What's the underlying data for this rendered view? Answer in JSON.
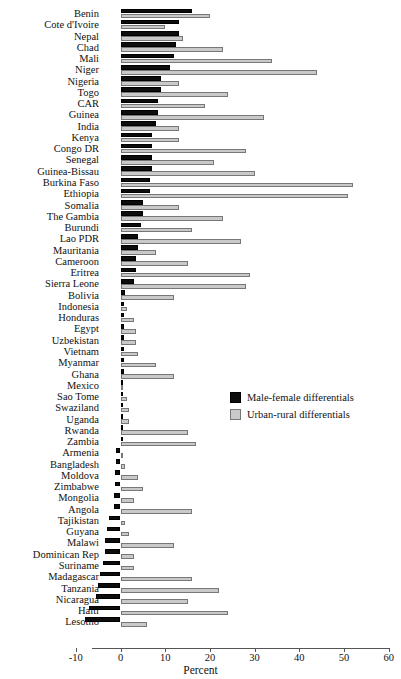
{
  "chart_data": {
    "type": "bar",
    "title": "",
    "subtitle": "",
    "xlabel": "Percent",
    "ylabel": "",
    "orientation": "horizontal",
    "xlim": [
      -10,
      60
    ],
    "xticks": [
      -10,
      0,
      10,
      20,
      30,
      40,
      50,
      60
    ],
    "xtick_labels": [
      "-10",
      "0",
      "10",
      "20",
      "30",
      "40",
      "50",
      "60"
    ],
    "grid": false,
    "legend_position": "middle-right",
    "colors": {
      "male_female": "#0d0d0d",
      "urban_rural": "#c9c9c9",
      "axis": "#555555",
      "background": "#ffffff"
    },
    "categories": [
      "Benin",
      "Cote d'Ivoire",
      "Nepal",
      "Chad",
      "Mali",
      "Niger",
      "Nigeria",
      "Togo",
      "CAR",
      "Guinea",
      "India",
      "Kenya",
      "Congo DR",
      "Senegal",
      "Guinea-Bissau",
      "Burkina Faso",
      "Ethiopia",
      "Somalia",
      "The Gambia",
      "Burundi",
      "Lao PDR",
      "Mauritania",
      "Cameroon",
      "Eritrea",
      "Sierra Leone",
      "Bolivia",
      "Indonesia",
      "Honduras",
      "Egypt",
      "Uzbekistan",
      "Vietnam",
      "Myanmar",
      "Ghana",
      "Mexico",
      "Sao Tome",
      "Swaziland",
      "Uganda",
      "Rwanda",
      "Zambia",
      "Armenia",
      "Bangladesh",
      "Moldova",
      "Zimbabwe",
      "Mongolia",
      "Angola",
      "Tajikistan",
      "Guyana",
      "Malawi",
      "Dominican Rep",
      "Suriname",
      "Madagascar",
      "Tanzania",
      "Nicaragua",
      "Haiti",
      "Lesotho"
    ],
    "series": [
      {
        "name": "Male-female differentials",
        "color": "#0d0d0d",
        "values": [
          16.0,
          13.0,
          13.0,
          12.5,
          12.0,
          11.0,
          9.0,
          9.0,
          8.5,
          8.5,
          8.0,
          7.0,
          7.0,
          7.0,
          7.0,
          6.5,
          6.5,
          5.0,
          5.0,
          4.5,
          4.0,
          4.0,
          3.5,
          3.5,
          3.0,
          1.0,
          0.8,
          0.7,
          0.7,
          0.7,
          0.7,
          0.7,
          0.7,
          0.3,
          0.2,
          0.2,
          0.2,
          0.2,
          0.2,
          -1.0,
          -1.0,
          -1.2,
          -1.2,
          -1.5,
          -1.5,
          -2.5,
          -3.0,
          -3.5,
          -3.5,
          -4.0,
          -4.5,
          -5.0,
          -5.5,
          -7.0,
          -8.0
        ]
      },
      {
        "name": "Urban-rural differentials",
        "color": "#c9c9c9",
        "values": [
          20.0,
          10.0,
          14.0,
          23.0,
          34.0,
          44.0,
          13.0,
          24.0,
          19.0,
          32.0,
          13.0,
          13.0,
          28.0,
          21.0,
          30.0,
          52.0,
          51.0,
          13.0,
          23.0,
          16.0,
          27.0,
          8.0,
          15.0,
          29.0,
          28.0,
          12.0,
          1.5,
          3.0,
          3.5,
          3.5,
          4.0,
          8.0,
          12.0,
          0.5,
          1.5,
          2.0,
          2.0,
          15.0,
          17.0,
          0.5,
          1.0,
          4.0,
          5.0,
          3.0,
          16.0,
          1.0,
          2.0,
          12.0,
          3.0,
          3.0,
          16.0,
          22.0,
          15.0,
          24.0,
          6.0
        ]
      }
    ]
  },
  "legend": {
    "items": [
      {
        "label": "Male-female differentials",
        "swatch": "male-female-swatch"
      },
      {
        "label": "Urban-rural differentials",
        "swatch": "urban-rural-swatch"
      }
    ]
  },
  "axis": {
    "title": "Percent"
  }
}
